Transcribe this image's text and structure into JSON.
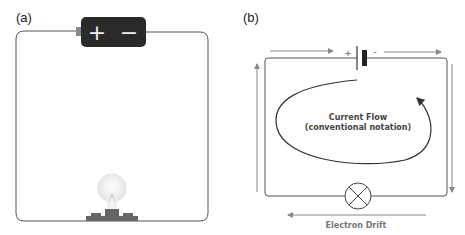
{
  "panel_a": {
    "label": "(a)",
    "battery": {
      "positive_symbol": "+",
      "negative_symbol": "−"
    },
    "components": [
      "battery",
      "wire-loop",
      "light-bulb"
    ]
  },
  "panel_b": {
    "label": "(b)",
    "battery": {
      "positive_symbol": "+",
      "negative_symbol": "-"
    },
    "current_label_line1": "Current Flow",
    "current_label_line2": "(conventional notation)",
    "electron_label": "Electron Drift",
    "components": [
      "battery-symbol",
      "wire-loop",
      "lamp-symbol"
    ]
  },
  "colors": {
    "wire": "#555555",
    "battery_body": "#2a2a2a",
    "arrow": "#888888",
    "text": "#333333",
    "bulb_base": "#666666"
  }
}
